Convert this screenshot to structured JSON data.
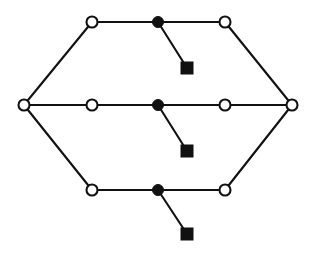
{
  "figure": {
    "title": "Hexagonal network graph",
    "background_color": "#ffffff",
    "stroke_color": "#111111",
    "fill_open": "#ffffff",
    "fill_solid": "#111111",
    "width": 315,
    "height": 257
  },
  "legend": {
    "open_circle_label": "open circle node",
    "filled_circle_label": "filled circle node",
    "filled_square_label": "filled square terminal"
  },
  "chart_data": {
    "type": "scatter",
    "title": "Hexagonal network graph",
    "xlabel": "",
    "ylabel": "",
    "grid": false,
    "legend_position": "none",
    "xlim": [
      0,
      315
    ],
    "ylim": [
      0,
      257
    ],
    "nodes": [
      {
        "id": "L",
        "x": 24,
        "y": 105,
        "marker": "open-circle",
        "radius": 5.5,
        "row": "middle",
        "role": "left-apex"
      },
      {
        "id": "R",
        "x": 292,
        "y": 105,
        "marker": "open-circle",
        "radius": 5.5,
        "row": "middle",
        "role": "right-apex"
      },
      {
        "id": "T1",
        "x": 92,
        "y": 22,
        "marker": "open-circle",
        "radius": 5.5,
        "row": "top",
        "role": "row-left"
      },
      {
        "id": "T2",
        "x": 158,
        "y": 22,
        "marker": "filled-circle",
        "radius": 5.5,
        "row": "top",
        "role": "row-hub"
      },
      {
        "id": "T3",
        "x": 225,
        "y": 22,
        "marker": "open-circle",
        "radius": 5.5,
        "row": "top",
        "role": "row-right"
      },
      {
        "id": "TS",
        "x": 187,
        "y": 68,
        "marker": "filled-square",
        "size": 12,
        "row": "top",
        "role": "terminal"
      },
      {
        "id": "M1",
        "x": 92,
        "y": 105,
        "marker": "open-circle",
        "radius": 5.5,
        "row": "middle",
        "role": "row-left"
      },
      {
        "id": "M2",
        "x": 158,
        "y": 105,
        "marker": "filled-circle",
        "radius": 5.5,
        "row": "middle",
        "role": "row-hub"
      },
      {
        "id": "M3",
        "x": 225,
        "y": 105,
        "marker": "open-circle",
        "radius": 5.5,
        "row": "middle",
        "role": "row-right"
      },
      {
        "id": "MS",
        "x": 187,
        "y": 151,
        "marker": "filled-square",
        "size": 12,
        "row": "middle",
        "role": "terminal"
      },
      {
        "id": "B1",
        "x": 92,
        "y": 190,
        "marker": "open-circle",
        "radius": 5.5,
        "row": "bottom",
        "role": "row-left"
      },
      {
        "id": "B2",
        "x": 158,
        "y": 190,
        "marker": "filled-circle",
        "radius": 5.5,
        "row": "bottom",
        "role": "row-hub"
      },
      {
        "id": "B3",
        "x": 225,
        "y": 190,
        "marker": "open-circle",
        "radius": 5.5,
        "row": "bottom",
        "role": "row-right"
      },
      {
        "id": "BS",
        "x": 187,
        "y": 234,
        "marker": "filled-square",
        "size": 12,
        "row": "bottom",
        "role": "terminal"
      }
    ],
    "edges": [
      {
        "from": "T1",
        "to": "T2",
        "kind": "horizontal"
      },
      {
        "from": "T2",
        "to": "T3",
        "kind": "horizontal"
      },
      {
        "from": "M1",
        "to": "M2",
        "kind": "horizontal"
      },
      {
        "from": "M2",
        "to": "M3",
        "kind": "horizontal"
      },
      {
        "from": "B1",
        "to": "B2",
        "kind": "horizontal"
      },
      {
        "from": "B2",
        "to": "B3",
        "kind": "horizontal"
      },
      {
        "from": "L",
        "to": "M1",
        "kind": "horizontal"
      },
      {
        "from": "M3",
        "to": "R",
        "kind": "horizontal"
      },
      {
        "from": "L",
        "to": "T1",
        "kind": "diagonal"
      },
      {
        "from": "T3",
        "to": "R",
        "kind": "diagonal"
      },
      {
        "from": "L",
        "to": "B1",
        "kind": "diagonal"
      },
      {
        "from": "B3",
        "to": "R",
        "kind": "diagonal"
      },
      {
        "from": "T2",
        "to": "TS",
        "kind": "stub"
      },
      {
        "from": "M2",
        "to": "MS",
        "kind": "stub"
      },
      {
        "from": "B2",
        "to": "BS",
        "kind": "stub"
      }
    ],
    "counts": {
      "open_circles": 9,
      "filled_circles": 3,
      "filled_squares": 3,
      "edges": 15
    }
  }
}
